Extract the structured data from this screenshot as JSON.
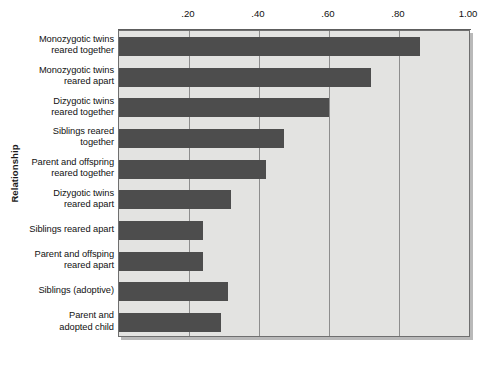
{
  "chart_data": {
    "type": "bar",
    "orientation": "horizontal",
    "title": "",
    "xlabel": "",
    "ylabel": "Relationship",
    "xlim": [
      0,
      1.0
    ],
    "ylim": null,
    "grid": true,
    "legend": null,
    "xticks": [
      0.2,
      0.4,
      0.6,
      0.8,
      1.0
    ],
    "xtick_labels": [
      ".20",
      ".40",
      ".60",
      ".80",
      "1.00"
    ],
    "bar_color": "#4d4d4d",
    "plot_background": "#e3e3e1",
    "categories": [
      "Monozygotic twins reared together",
      "Monozygotic twins reared apart",
      "Dizygotic twins reared together",
      "Siblings reared together",
      "Parent and offspring reared together",
      "Dizygotic twins reared apart",
      "Siblings reared apart",
      "Parent and offsping reared apart",
      "Siblings (adoptive)",
      "Parent and adopted child"
    ],
    "category_lines": [
      [
        "Monozygotic twins",
        "reared together"
      ],
      [
        "Monozygotic twins",
        "reared apart"
      ],
      [
        "Dizygotic twins",
        "reared together"
      ],
      [
        "Siblings reared",
        "together"
      ],
      [
        "Parent and offspring",
        "reared together"
      ],
      [
        "Dizygotic twins",
        "reared apart"
      ],
      [
        "Siblings reared apart"
      ],
      [
        "Parent and offsping",
        "reared apart"
      ],
      [
        "Siblings (adoptive)"
      ],
      [
        "Parent and",
        "adopted child"
      ]
    ],
    "values": [
      0.86,
      0.72,
      0.6,
      0.47,
      0.42,
      0.32,
      0.24,
      0.24,
      0.31,
      0.29
    ]
  }
}
